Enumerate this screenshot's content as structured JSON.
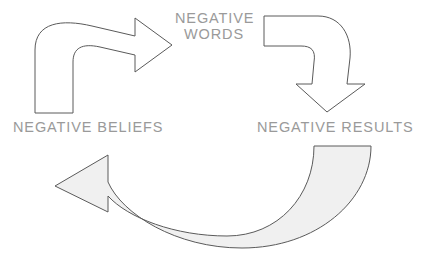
{
  "diagram": {
    "type": "cycle-diagram",
    "background_color": "#ffffff",
    "label_color": "#9a9a9a",
    "stroke_color": "#5a5a5a",
    "shade_color": "#f0f0f0",
    "nodes": [
      {
        "id": "negative-words",
        "line1": "NEGATIVE",
        "line2": "WORDS",
        "text": "NEGATIVE WORDS"
      },
      {
        "id": "negative-beliefs",
        "text": "NEGATIVE BELIEFS"
      },
      {
        "id": "negative-results",
        "text": "NEGATIVE RESULTS"
      }
    ],
    "arrows": [
      {
        "id": "beliefs-to-words",
        "icon": "curved-arrow-up-right-icon",
        "from": "negative-beliefs",
        "to": "negative-words",
        "style": "outline"
      },
      {
        "id": "words-to-results",
        "icon": "curved-arrow-down-icon",
        "from": "negative-words",
        "to": "negative-results",
        "style": "outline"
      },
      {
        "id": "results-to-beliefs",
        "icon": "curved-arrow-up-left-icon",
        "from": "negative-results",
        "to": "negative-beliefs",
        "style": "shaded"
      }
    ]
  }
}
